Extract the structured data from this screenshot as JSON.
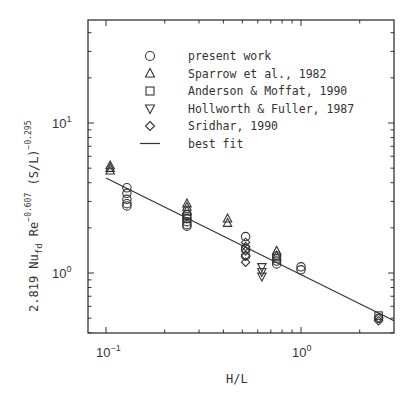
{
  "chart_data": {
    "type": "scatter",
    "title": "",
    "xlabel": "H/L",
    "ylabel": "2.819 Nu_fd Re^-0.607 (S/L)^-0.295",
    "xscale": "log",
    "yscale": "log",
    "xlim": [
      0.091,
      3.6
    ],
    "ylim": [
      0.36,
      38
    ],
    "x_tick_labels": [
      "10^-1",
      "10^0"
    ],
    "y_tick_labels": [
      "10^0",
      "10^1"
    ],
    "grid": false,
    "legend_position": "upper-center",
    "legend": [
      {
        "label": "present work",
        "marker": "circle"
      },
      {
        "label": "Sparrow et al., 1982",
        "marker": "triangle-up"
      },
      {
        "label": "Anderson & Moffat, 1990",
        "marker": "square"
      },
      {
        "label": "Hollworth & Fuller, 1987",
        "marker": "triangle-down"
      },
      {
        "label": "Sridhar, 1990",
        "marker": "diamond"
      },
      {
        "label": "best fit",
        "marker": "line"
      }
    ],
    "series": [
      {
        "name": "present work",
        "marker": "circle",
        "x": [
          0.128,
          0.128,
          0.128,
          0.128,
          0.128,
          0.26,
          0.26,
          0.26,
          0.26,
          0.26,
          0.52,
          0.52,
          0.52,
          0.75,
          0.75,
          0.75,
          1.0,
          1.0,
          2.5
        ],
        "y": [
          3.7,
          3.4,
          3.1,
          2.9,
          2.8,
          2.45,
          2.3,
          2.2,
          2.1,
          2.05,
          1.75,
          1.45,
          1.3,
          1.3,
          1.2,
          1.15,
          1.1,
          1.05,
          0.5
        ]
      },
      {
        "name": "Sparrow et al., 1982",
        "marker": "triangle-up",
        "x": [
          0.105,
          0.105,
          0.105,
          0.26,
          0.26,
          0.26,
          0.42,
          0.42,
          0.75,
          0.75
        ],
        "y": [
          5.2,
          5.0,
          4.8,
          2.9,
          2.75,
          2.6,
          2.3,
          2.15,
          1.4,
          1.3
        ]
      },
      {
        "name": "Anderson & Moffat, 1990",
        "marker": "square",
        "x": [
          0.26,
          0.26,
          0.75,
          2.5
        ],
        "y": [
          2.4,
          2.3,
          1.25,
          0.52
        ]
      },
      {
        "name": "Hollworth & Fuller, 1987",
        "marker": "triangle-down",
        "x": [
          0.63,
          0.63,
          0.63
        ],
        "y": [
          1.1,
          1.02,
          0.95
        ]
      },
      {
        "name": "Sridhar, 1990",
        "marker": "diamond",
        "x": [
          0.52,
          0.52,
          0.52,
          0.52,
          0.52,
          2.5,
          2.5
        ],
        "y": [
          1.6,
          1.5,
          1.4,
          1.3,
          1.18,
          0.5,
          0.48
        ]
      },
      {
        "name": "best fit",
        "type": "line",
        "x": [
          0.1,
          3.5
        ],
        "y": [
          4.3,
          0.48
        ]
      }
    ]
  }
}
